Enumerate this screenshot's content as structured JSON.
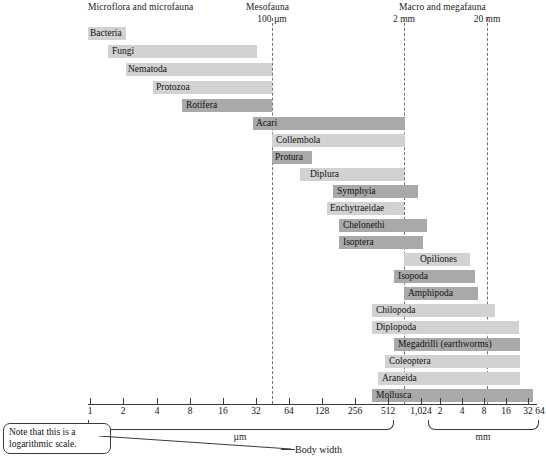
{
  "figure": {
    "caption": "Body width",
    "note": "Note that this is a logarithmic scale."
  },
  "groups": [
    {
      "id": "microflora",
      "title": "Microflora and microfauna",
      "boundary_label": "",
      "x": 88
    },
    {
      "id": "mesofauna",
      "title": "Mesofauna",
      "boundary_label": "100 µm",
      "x": 272
    },
    {
      "id": "macrofauna",
      "title": "Macro and megafauna",
      "boundary_label": "2 mm",
      "x": 404
    }
  ],
  "boundaries": [
    {
      "label": "100 µm",
      "x": 272,
      "label_x": 272
    },
    {
      "label": "2 mm",
      "x": 404,
      "label_x": 404
    },
    {
      "label": "20 mm",
      "x": 487,
      "label_x": 487
    }
  ],
  "axis": {
    "x_start": 88,
    "x_end": 537,
    "sections": [
      {
        "unit": "µm",
        "brace_left": 88,
        "brace_right": 392,
        "label_x": 240,
        "ticks": [
          {
            "label": "1",
            "x": 90
          },
          {
            "label": "2",
            "x": 123
          },
          {
            "label": "4",
            "x": 157
          },
          {
            "label": "8",
            "x": 190
          },
          {
            "label": "16",
            "x": 223
          },
          {
            "label": "32",
            "x": 256
          },
          {
            "label": "64",
            "x": 289
          },
          {
            "label": "128",
            "x": 322
          },
          {
            "label": "256",
            "x": 355
          },
          {
            "label": "512",
            "x": 388
          },
          {
            "label": "1,024",
            "x": 421
          }
        ]
      },
      {
        "unit": "mm",
        "brace_left": 428,
        "brace_right": 537,
        "label_x": 483,
        "ticks": [
          {
            "label": "2",
            "x": 440
          },
          {
            "label": "4",
            "x": 462
          },
          {
            "label": "8",
            "x": 484
          },
          {
            "label": "16",
            "x": 506
          },
          {
            "label": "32",
            "x": 528
          },
          {
            "label": "64",
            "x": 550
          }
        ]
      }
    ]
  },
  "chart_data": {
    "type": "bar",
    "xlabel": "Body width",
    "ylabel": "",
    "scale": "logarithmic",
    "annotations": [
      "Note that this is a logarithmic scale."
    ],
    "axis_breaks": [
      "100 µm",
      "2 mm",
      "20 mm"
    ],
    "categories": [
      "Bacteria",
      "Fungi",
      "Nematoda",
      "Protozoa",
      "Rotifera",
      "Acari",
      "Collembola",
      "Protura",
      "Diplura",
      "Symphyia",
      "Enchytraeidae",
      "Chelonethi",
      "Isoptera",
      "Opiliones",
      "Isopoda",
      "Amphipoda",
      "Chilopoda",
      "Diplopoda",
      "Megadrilli (earthworms)",
      "Coleoptera",
      "Araneida",
      "Mollusca"
    ],
    "bars": [
      {
        "label": "Bacteria",
        "shade": "light",
        "x0": 88,
        "x1": 126,
        "y": 27,
        "label_x": 90,
        "label_inside": true
      },
      {
        "label": "Fungi",
        "shade": "light",
        "x0": 108,
        "x1": 257,
        "y": 45,
        "label_x": 112,
        "label_inside": true
      },
      {
        "label": "Nematoda",
        "shade": "light",
        "x0": 126,
        "x1": 272,
        "y": 63,
        "label_x": 128,
        "label_inside": true
      },
      {
        "label": "Protozoa",
        "shade": "light",
        "x0": 153,
        "x1": 272,
        "y": 81,
        "label_x": 156,
        "label_inside": true
      },
      {
        "label": "Rotifera",
        "shade": "dark",
        "x0": 182,
        "x1": 272,
        "y": 99,
        "label_x": 186,
        "label_inside": true
      },
      {
        "label": "Acari",
        "shade": "dark",
        "x0": 253,
        "x1": 405,
        "y": 117,
        "label_x": 256,
        "label_inside": true
      },
      {
        "label": "Collembola",
        "shade": "light",
        "x0": 272,
        "x1": 405,
        "y": 134,
        "label_x": 276,
        "label_inside": true
      },
      {
        "label": "Protura",
        "shade": "dark",
        "x0": 272,
        "x1": 312,
        "y": 151,
        "label_x": 275,
        "label_inside": true
      },
      {
        "label": "Diplura",
        "shade": "light",
        "x0": 300,
        "x1": 404,
        "y": 168,
        "label_x": 310,
        "label_inside": true
      },
      {
        "label": "Symphyia",
        "shade": "dark",
        "x0": 333,
        "x1": 418,
        "y": 185,
        "label_x": 337,
        "label_inside": true
      },
      {
        "label": "Enchytraeidae",
        "shade": "light",
        "x0": 327,
        "x1": 404,
        "y": 202,
        "label_x": 330,
        "label_inside": true
      },
      {
        "label": "Chelonethi",
        "shade": "dark",
        "x0": 339,
        "x1": 427,
        "y": 219,
        "label_x": 343,
        "label_inside": true
      },
      {
        "label": "Isoptera",
        "shade": "dark",
        "x0": 339,
        "x1": 423,
        "y": 236,
        "label_x": 343,
        "label_inside": true
      },
      {
        "label": "Opiliones",
        "shade": "light",
        "x0": 404,
        "x1": 470,
        "y": 253,
        "label_x": 420,
        "label_inside": true
      },
      {
        "label": "Isopoda",
        "shade": "dark",
        "x0": 394,
        "x1": 475,
        "y": 270,
        "label_x": 398,
        "label_inside": true
      },
      {
        "label": "Amphipoda",
        "shade": "dark",
        "x0": 404,
        "x1": 478,
        "y": 287,
        "label_x": 408,
        "label_inside": true
      },
      {
        "label": "Chilopoda",
        "shade": "light",
        "x0": 372,
        "x1": 495,
        "y": 304,
        "label_x": 376,
        "label_inside": true
      },
      {
        "label": "Diplopoda",
        "shade": "light",
        "x0": 372,
        "x1": 519,
        "y": 321,
        "label_x": 376,
        "label_inside": true
      },
      {
        "label": "Megadrilli (earthworms)",
        "shade": "dark",
        "x0": 394,
        "x1": 520,
        "y": 338,
        "label_x": 398,
        "label_inside": true
      },
      {
        "label": "Coleoptera",
        "shade": "light",
        "x0": 385,
        "x1": 520,
        "y": 355,
        "label_x": 389,
        "label_inside": true
      },
      {
        "label": "Araneida",
        "shade": "light",
        "x0": 378,
        "x1": 520,
        "y": 372,
        "label_x": 382,
        "label_inside": true
      },
      {
        "label": "Mollusca",
        "shade": "dark",
        "x0": 372,
        "x1": 533,
        "y": 389,
        "label_x": 376,
        "label_inside": true
      }
    ]
  }
}
